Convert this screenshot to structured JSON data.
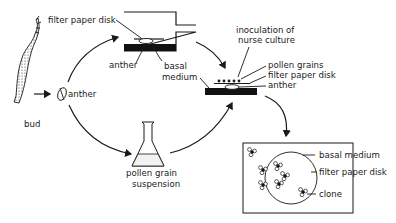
{
  "diagram": {
    "stages": {
      "bud": {
        "label": "bud"
      },
      "anther": {
        "label": "anther"
      },
      "anther_culture": {
        "labels": {
          "filter_paper_disk": "filter paper disk",
          "anther": "anther",
          "basal_medium_1": "basal",
          "basal_medium_2": "medium"
        }
      },
      "suspension": {
        "label_1": "pollen grain",
        "label_2": "suspension"
      },
      "nurse_culture": {
        "labels": {
          "inoculation_1": "inoculation of",
          "inoculation_2": "nurse culture",
          "pollen_grains": "pollen grains",
          "filter_paper_disk": "filter paper disk",
          "anther": "anther"
        }
      },
      "result_plate": {
        "labels": {
          "basal_medium": "basal medium",
          "filter_paper_disk": "filter paper disk",
          "clone": "clone"
        }
      }
    },
    "colors": {
      "ink": "#1a1a1a",
      "background": "#ffffff",
      "medium_fill": "#111111"
    }
  }
}
